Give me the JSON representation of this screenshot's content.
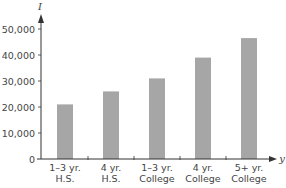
{
  "chart_data": {
    "type": "bar",
    "title": "",
    "xlabel": "y",
    "ylabel": "I",
    "categories": [
      "1–3 yr. H.S.",
      "4 yr. H.S.",
      "1–3 yr. College",
      "4 yr. College",
      "5+ yr. College"
    ],
    "category_lines": [
      [
        "1–3 yr.",
        "H.S."
      ],
      [
        "4 yr.",
        "H.S."
      ],
      [
        "1–3 yr.",
        "College"
      ],
      [
        "4 yr.",
        "College"
      ],
      [
        "5+ yr.",
        "College"
      ]
    ],
    "values": [
      21000,
      26000,
      31000,
      39000,
      46500
    ],
    "ylim": [
      0,
      55000
    ],
    "yticks": [
      0,
      10000,
      20000,
      30000,
      40000,
      50000
    ],
    "ytick_labels": [
      "0",
      "10,000",
      "20,000",
      "30,000",
      "40,000",
      "50,000"
    ],
    "grid": false,
    "legend": null,
    "bar_color": "#a6a6a6",
    "axis_color": "#333333"
  }
}
